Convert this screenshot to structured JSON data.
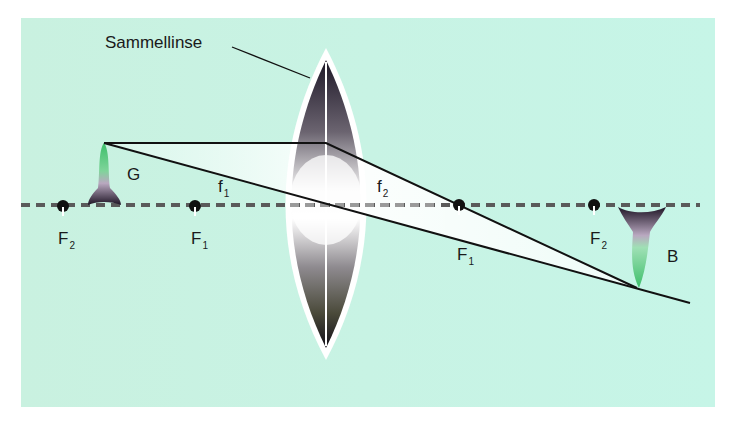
{
  "diagram": {
    "lens_label": "Sammellinse",
    "object_label": "G",
    "image_label": "B",
    "focal_length_labels": [
      {
        "main": "f",
        "sub": "1"
      },
      {
        "main": "f",
        "sub": "2"
      }
    ],
    "focal_points": [
      {
        "main": "F",
        "sub": "2",
        "side": "left-outer"
      },
      {
        "main": "F",
        "sub": "1",
        "side": "left-inner"
      },
      {
        "main": "F",
        "sub": "1",
        "side": "right-inner"
      },
      {
        "main": "F",
        "sub": "2",
        "side": "right-outer"
      }
    ],
    "colors": {
      "background": "#c8f3e4",
      "axis": "#555555",
      "rays": "#111111",
      "object_tip": "#3cbf6a",
      "lens_dark": "#2a2233"
    }
  }
}
